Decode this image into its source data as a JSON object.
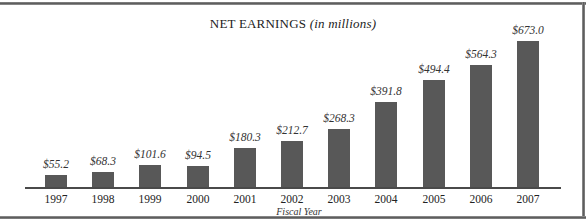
{
  "chart_data": {
    "type": "bar",
    "title": "NET EARNINGS",
    "title_suffix": "(in millions)",
    "xlabel": "Fiscal Year",
    "ylabel": "",
    "categories": [
      "1997",
      "1998",
      "1999",
      "2000",
      "2001",
      "2002",
      "2003",
      "2004",
      "2005",
      "2006",
      "2007"
    ],
    "values": [
      55.2,
      68.3,
      101.6,
      94.5,
      180.3,
      212.7,
      268.3,
      391.8,
      494.4,
      564.3,
      673.0
    ],
    "data_labels": [
      "$55.2",
      "$68.3",
      "$101.6",
      "$94.5",
      "$180.3",
      "$212.7",
      "$268.3",
      "$391.8",
      "$494.4",
      "$564.3",
      "$673.0"
    ],
    "ylim": [
      0,
      673.0
    ],
    "grid": false,
    "legend": "none",
    "bar_color": "#585858"
  }
}
